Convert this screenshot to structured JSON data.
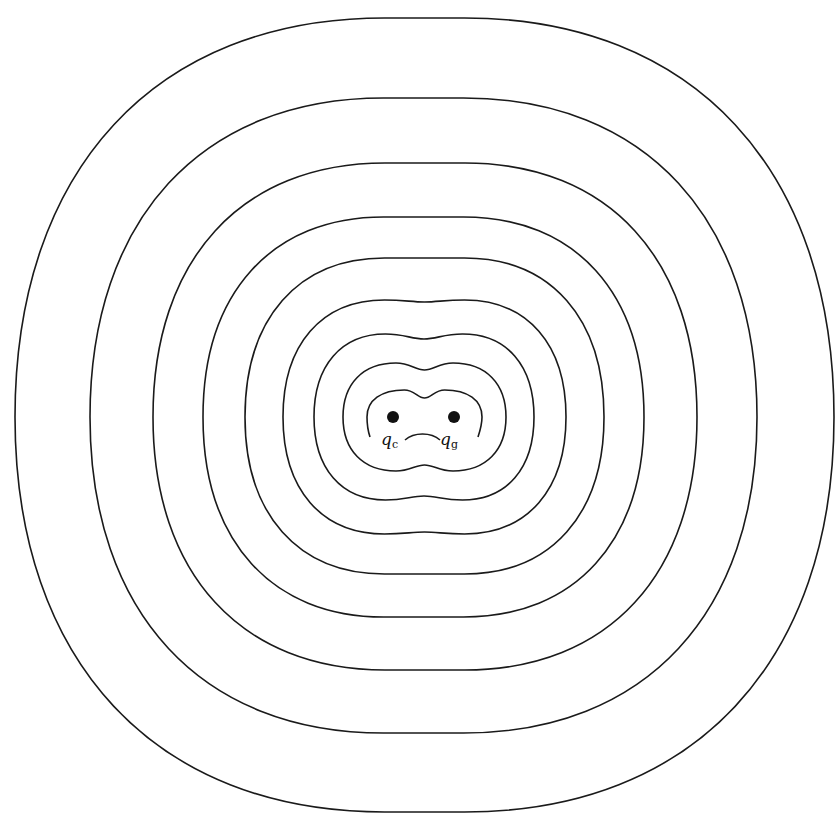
{
  "figure": {
    "type": "equipotential contour diagram",
    "stroke_color": "#1a1a1a",
    "background": "#ffffff"
  },
  "charges": [
    {
      "id": "c",
      "symbol": "q",
      "subscript": "c",
      "cx": 393,
      "cy": 417,
      "r": 6
    },
    {
      "id": "g",
      "symbol": "q",
      "subscript": "g",
      "cx": 454,
      "cy": 417,
      "r": 6
    }
  ],
  "labels": {
    "qc": {
      "symbol": "q",
      "subscript": "c"
    },
    "qg": {
      "symbol": "q",
      "subscript": "g"
    }
  },
  "contours": [
    {
      "index": 1,
      "left": 367,
      "right": 482,
      "top": 390,
      "top_dip": 398,
      "open_bottom": true
    },
    {
      "index": 2,
      "left": 343,
      "right": 506,
      "top": 363,
      "top_dip": 370,
      "bottom": 471,
      "bottom_bump": 465
    },
    {
      "index": 3,
      "left": 314,
      "right": 534,
      "top": 334,
      "top_dip": 339,
      "bottom": 500,
      "bottom_bump": 496
    },
    {
      "index": 4,
      "left": 283,
      "right": 566,
      "top": 300,
      "top_dip": 302,
      "bottom": 534,
      "bottom_bump": 532
    },
    {
      "index": 5,
      "left": 245,
      "right": 604,
      "top": 258,
      "bottom": 574
    },
    {
      "index": 6,
      "left": 203,
      "right": 644,
      "top": 217,
      "bottom": 617
    },
    {
      "index": 7,
      "left": 153,
      "right": 697,
      "top": 163,
      "bottom": 670
    },
    {
      "index": 8,
      "left": 90,
      "right": 757,
      "top": 98,
      "bottom": 733
    },
    {
      "index": 9,
      "left": 15,
      "right": 834,
      "top": 18,
      "bottom": 812
    }
  ]
}
